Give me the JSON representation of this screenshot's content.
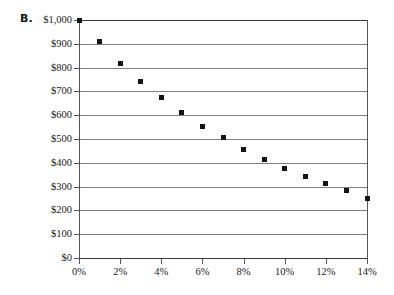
{
  "panel": {
    "label": "B."
  },
  "chart_data": {
    "type": "scatter",
    "title": "",
    "subtitle": "",
    "xlabel": "",
    "ylabel": "",
    "x": [
      0,
      1,
      2,
      3,
      4,
      5,
      6,
      7,
      8,
      9,
      10,
      11,
      12,
      13,
      14
    ],
    "values": [
      1000,
      908,
      818,
      743,
      673,
      610,
      553,
      505,
      454,
      415,
      377,
      342,
      315,
      285,
      252
    ],
    "series": [
      {
        "name": "Present value",
        "values": [
          1000,
          908,
          818,
          743,
          673,
          610,
          553,
          505,
          454,
          415,
          377,
          342,
          315,
          285,
          252
        ]
      }
    ],
    "xlim": [
      0,
      14
    ],
    "ylim": [
      0,
      1000
    ],
    "xtick_values": [
      0,
      2,
      4,
      6,
      8,
      10,
      12,
      14
    ],
    "xtick_labels": [
      "0%",
      "2%",
      "4%",
      "6%",
      "8%",
      "10%",
      "12%",
      "14%"
    ],
    "ytick_values": [
      0,
      100,
      200,
      300,
      400,
      500,
      600,
      700,
      800,
      900,
      1000
    ],
    "ytick_labels": [
      "$0",
      "$100",
      "$200",
      "$300",
      "$400",
      "$500",
      "$600",
      "$700",
      "$800",
      "$900",
      "$1,000"
    ],
    "grid": "horizontal",
    "legend": "none",
    "marker": "square",
    "marker_color": "#141414",
    "gridline_color": "#808080",
    "axis_color": "#555555"
  }
}
